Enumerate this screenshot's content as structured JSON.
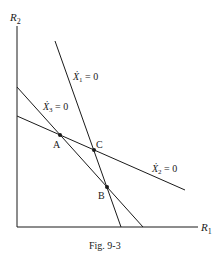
{
  "figure": {
    "caption": "Fig. 9-3",
    "axes": {
      "x_label_main": "R",
      "x_label_sub": "1",
      "y_label_main": "R",
      "y_label_sub": "2"
    },
    "lines": [
      {
        "id": "x1",
        "label_main": "Ẋ",
        "label_sub": "1",
        "label_eq": " = 0"
      },
      {
        "id": "x2",
        "label_main": "Ẋ",
        "label_sub": "2",
        "label_eq": " = 0"
      },
      {
        "id": "x3",
        "label_main": "Ẋ",
        "label_sub": "3",
        "label_eq": " = 0"
      }
    ],
    "points": [
      {
        "id": "A",
        "label": "A"
      },
      {
        "id": "B",
        "label": "B"
      },
      {
        "id": "C",
        "label": "C"
      }
    ],
    "colors": {
      "ink": "#1a1a1a",
      "background": "#ffffff"
    }
  }
}
